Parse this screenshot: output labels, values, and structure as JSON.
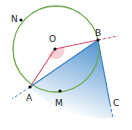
{
  "diagram": {
    "type": "circle-inscribed-angle-tangent",
    "colors": {
      "circle": "#6fa84a",
      "radius_lines": "#d4506a",
      "chord_tangent": "#3a7fc4",
      "angle_fill": "#f3c4cc",
      "shade": "#2f7fc8",
      "point": "#111111"
    },
    "points": [
      {
        "name": "N",
        "label": "N"
      },
      {
        "name": "O",
        "label": "O"
      },
      {
        "name": "B",
        "label": "B"
      },
      {
        "name": "A",
        "label": "A"
      },
      {
        "name": "M",
        "label": "M"
      },
      {
        "name": "C",
        "label": "C"
      }
    ]
  }
}
